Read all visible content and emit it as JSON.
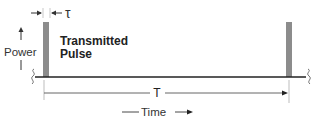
{
  "diagram": {
    "type": "pulse-timing",
    "labels": {
      "tau": "τ",
      "power": "Power",
      "pulse_line1": "Transmitted",
      "pulse_line2": "Pulse",
      "period": "T",
      "time": "Time"
    },
    "colors": {
      "background": "#ffffff",
      "pulse": "#8c8c8c",
      "baseline": "#222222",
      "dimension": "#333333",
      "guide": "#bdbdbd"
    },
    "pulses": [
      {
        "name": "first-pulse",
        "x": 43,
        "width": 6
      },
      {
        "name": "second-pulse",
        "x": 286,
        "width": 6
      }
    ]
  }
}
